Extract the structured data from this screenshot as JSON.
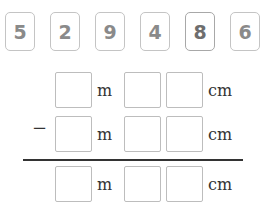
{
  "cards": [
    "5",
    "2",
    "9",
    "4",
    "8",
    "6"
  ],
  "rows": [
    {
      "operator": "",
      "m_unit": "m",
      "cm_unit": "cm",
      "m_value": "",
      "cm_tens": "",
      "cm_ones": ""
    },
    {
      "operator": "−",
      "m_unit": "m",
      "cm_unit": "cm",
      "m_value": "",
      "cm_tens": "",
      "cm_ones": ""
    },
    {
      "operator": "",
      "m_unit": "m",
      "cm_unit": "cm",
      "m_value": "",
      "cm_tens": "",
      "cm_ones": ""
    }
  ]
}
